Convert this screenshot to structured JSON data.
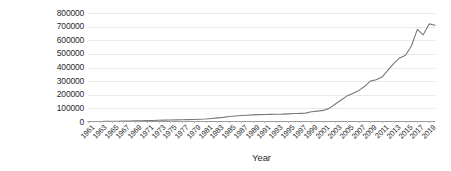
{
  "chart_data": {
    "type": "line",
    "title": "",
    "xlabel": "Year",
    "ylabel": "Production (in tonnes)",
    "ylim": [
      0,
      800000
    ],
    "xlim": [
      1961,
      2020
    ],
    "grid": true,
    "legend": false,
    "line_color": "#7a7a7a",
    "gridline_color": "#e9e9e9",
    "axis_color": "#9a9a9a",
    "y_ticks": [
      "0",
      "100000",
      "200000",
      "300000",
      "400000",
      "500000",
      "600000",
      "700000",
      "800000"
    ],
    "y_tick_values": [
      0,
      100000,
      200000,
      300000,
      400000,
      500000,
      600000,
      700000,
      800000
    ],
    "x_tick_labels": [
      "1961",
      "1963",
      "1965",
      "1967",
      "1969",
      "1971",
      "1973",
      "1975",
      "1977",
      "1979",
      "1981",
      "1983",
      "1985",
      "1987",
      "1989",
      "1991",
      "1993",
      "1995",
      "1997",
      "1999",
      "2001",
      "2003",
      "2005",
      "2007",
      "2009",
      "2011",
      "2013",
      "2015",
      "2017",
      "2019"
    ],
    "x_tick_values": [
      1961,
      1963,
      1965,
      1967,
      1969,
      1971,
      1973,
      1975,
      1977,
      1979,
      1981,
      1983,
      1985,
      1987,
      1989,
      1991,
      1993,
      1995,
      1997,
      1999,
      2001,
      2003,
      2005,
      2007,
      2009,
      2011,
      2013,
      2015,
      2017,
      2019
    ],
    "x": [
      1961,
      1962,
      1963,
      1964,
      1965,
      1966,
      1967,
      1968,
      1969,
      1970,
      1971,
      1972,
      1973,
      1974,
      1975,
      1976,
      1977,
      1978,
      1979,
      1980,
      1981,
      1982,
      1983,
      1984,
      1985,
      1986,
      1987,
      1988,
      1989,
      1990,
      1991,
      1992,
      1993,
      1994,
      1995,
      1996,
      1997,
      1998,
      1999,
      2000,
      2001,
      2002,
      2003,
      2004,
      2005,
      2006,
      2007,
      2008,
      2009,
      2010,
      2011,
      2012,
      2013,
      2014,
      2015,
      2016,
      2017,
      2018,
      2019,
      2020
    ],
    "values": [
      3000,
      3500,
      4000,
      4500,
      5000,
      5500,
      6500,
      7500,
      8500,
      9500,
      10500,
      11500,
      12500,
      13500,
      14500,
      15500,
      16500,
      17500,
      18500,
      20000,
      22000,
      26000,
      30000,
      34000,
      40000,
      44000,
      48000,
      50000,
      52000,
      54000,
      55000,
      56000,
      57000,
      58000,
      60000,
      62000,
      63000,
      65000,
      75000,
      80000,
      85000,
      100000,
      130000,
      160000,
      190000,
      210000,
      230000,
      260000,
      300000,
      310000,
      330000,
      380000,
      430000,
      470000,
      490000,
      560000,
      680000,
      640000,
      720000,
      710000
    ],
    "series_name": "Production"
  }
}
